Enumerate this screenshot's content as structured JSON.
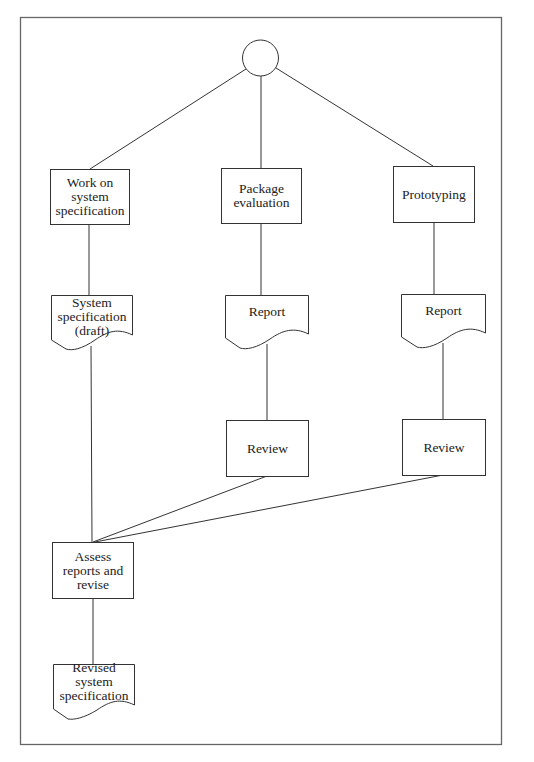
{
  "diagram": {
    "type": "process-flow",
    "start_node": {
      "shape": "circle",
      "label": ""
    },
    "nodes": [
      {
        "id": "work",
        "shape": "process",
        "label": "Work on system specification",
        "lines": [
          "Work on",
          "system",
          "specification"
        ]
      },
      {
        "id": "package",
        "shape": "process",
        "label": "Package evaluation",
        "lines": [
          "Package",
          "evaluation"
        ]
      },
      {
        "id": "proto",
        "shape": "process",
        "label": "Prototyping",
        "lines": [
          "Prototyping"
        ]
      },
      {
        "id": "draft",
        "shape": "document",
        "label": "System specification (draft)",
        "lines": [
          "System",
          "specification",
          "(draft)"
        ]
      },
      {
        "id": "report1",
        "shape": "document",
        "label": "Report",
        "lines": [
          "Report"
        ]
      },
      {
        "id": "report2",
        "shape": "document",
        "label": "Report",
        "lines": [
          "Report"
        ]
      },
      {
        "id": "review1",
        "shape": "process",
        "label": "Review",
        "lines": [
          "Review"
        ]
      },
      {
        "id": "review2",
        "shape": "process",
        "label": "Review",
        "lines": [
          "Review"
        ]
      },
      {
        "id": "assess",
        "shape": "process",
        "label": "Assess reports and revise",
        "lines": [
          "Assess",
          "reports and",
          "revise"
        ]
      },
      {
        "id": "revised",
        "shape": "document",
        "label": "Revised system specification",
        "lines": [
          "Revised system",
          "specification"
        ]
      }
    ],
    "edges": [
      [
        "start",
        "work"
      ],
      [
        "start",
        "package"
      ],
      [
        "start",
        "proto"
      ],
      [
        "work",
        "draft"
      ],
      [
        "package",
        "report1"
      ],
      [
        "proto",
        "report2"
      ],
      [
        "report1",
        "review1"
      ],
      [
        "report2",
        "review2"
      ],
      [
        "draft",
        "assess"
      ],
      [
        "review1",
        "assess"
      ],
      [
        "review2",
        "assess"
      ],
      [
        "assess",
        "revised"
      ]
    ],
    "colors": {
      "stroke": "#333333",
      "frame": "#666666",
      "background": "#ffffff"
    }
  },
  "labels": {
    "work": "Work on system specification",
    "package": "Package evaluation",
    "proto": "Prototyping",
    "draft": "System specification (draft)",
    "report1": "Report",
    "report2": "Report",
    "review1": "Review",
    "review2": "Review",
    "assess": "Assess reports and revise",
    "revised": "Revised system specification"
  }
}
